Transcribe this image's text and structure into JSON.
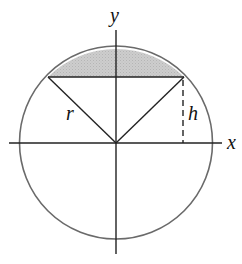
{
  "diagram": {
    "labels": {
      "y_axis": "y",
      "x_axis": "x",
      "radius": "r",
      "height": "h"
    },
    "colors": {
      "shade": "#c8c8c8",
      "circle": "#666666",
      "lines": "#222222"
    }
  }
}
